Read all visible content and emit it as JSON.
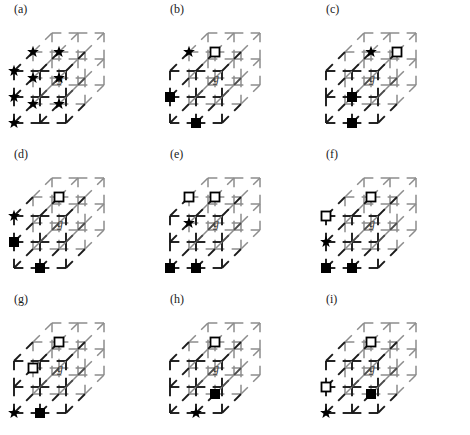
{
  "figure": {
    "type": "lattice-diagram-grid",
    "columns": 3,
    "rows": 3,
    "center_label": "g",
    "lattice": {
      "dimensions": [
        3,
        3,
        3
      ],
      "projection": "oblique",
      "edge_style": "broken-segments",
      "front_edge_color": "#1a1a1a",
      "interior_edge_color": "#8c8c8c",
      "depth_offset_x": 19,
      "depth_offset_y": -19,
      "cell_size": 26
    },
    "markers": {
      "star": {
        "name": "star-marker",
        "fill": "#000000",
        "label": "star"
      },
      "filled_square": {
        "name": "filled-square-marker",
        "fill": "#000000",
        "label": "filled square"
      },
      "open_square": {
        "name": "open-square-marker",
        "fill": "#ffffff",
        "stroke": "#000000",
        "label": "open square"
      }
    },
    "panels": [
      {
        "id": "a",
        "label": "(a)",
        "markers": [
          {
            "type": "star",
            "i": 0,
            "j": 0,
            "k": 0
          },
          {
            "type": "star",
            "i": 0,
            "j": 1,
            "k": 0
          },
          {
            "type": "star",
            "i": 0,
            "j": 2,
            "k": 0
          },
          {
            "type": "star",
            "i": 0,
            "j": 0,
            "k": 1
          },
          {
            "type": "star",
            "i": 0,
            "j": 1,
            "k": 1
          },
          {
            "type": "star",
            "i": 0,
            "j": 2,
            "k": 1
          },
          {
            "type": "star",
            "i": 1,
            "j": 0,
            "k": 1
          },
          {
            "type": "star",
            "i": 1,
            "j": 1,
            "k": 1
          },
          {
            "type": "star",
            "i": 1,
            "j": 2,
            "k": 1
          }
        ]
      },
      {
        "id": "b",
        "label": "(b)",
        "markers": [
          {
            "type": "star",
            "i": 0,
            "j": 2,
            "k": 1
          },
          {
            "type": "open_square",
            "i": 1,
            "j": 2,
            "k": 1
          },
          {
            "type": "filled_square",
            "i": 0,
            "j": 1,
            "k": 0
          },
          {
            "type": "filled_square",
            "i": 1,
            "j": 0,
            "k": 0
          }
        ]
      },
      {
        "id": "c",
        "label": "(c)",
        "markers": [
          {
            "type": "star",
            "i": 1,
            "j": 2,
            "k": 1
          },
          {
            "type": "open_square",
            "i": 2,
            "j": 2,
            "k": 1
          },
          {
            "type": "filled_square",
            "i": 1,
            "j": 1,
            "k": 0
          },
          {
            "type": "filled_square",
            "i": 1,
            "j": 0,
            "k": 0
          }
        ]
      },
      {
        "id": "d",
        "label": "(d)",
        "markers": [
          {
            "type": "open_square",
            "i": 1,
            "j": 2,
            "k": 1
          },
          {
            "type": "star",
            "i": 0,
            "j": 2,
            "k": 0
          },
          {
            "type": "filled_square",
            "i": 0,
            "j": 1,
            "k": 0
          },
          {
            "type": "filled_square",
            "i": 1,
            "j": 0,
            "k": 0
          }
        ]
      },
      {
        "id": "e",
        "label": "(e)",
        "markers": [
          {
            "type": "open_square",
            "i": 0,
            "j": 2,
            "k": 1
          },
          {
            "type": "open_square",
            "i": 1,
            "j": 2,
            "k": 1
          },
          {
            "type": "star",
            "i": 0,
            "j": 1,
            "k": 1
          },
          {
            "type": "filled_square",
            "i": 0,
            "j": 0,
            "k": 0
          },
          {
            "type": "filled_square",
            "i": 1,
            "j": 0,
            "k": 0
          }
        ]
      },
      {
        "id": "f",
        "label": "(f)",
        "markers": [
          {
            "type": "open_square",
            "i": 1,
            "j": 2,
            "k": 1
          },
          {
            "type": "open_square",
            "i": 0,
            "j": 2,
            "k": 0
          },
          {
            "type": "star",
            "i": 0,
            "j": 1,
            "k": 0
          },
          {
            "type": "filled_square",
            "i": 0,
            "j": 0,
            "k": 0
          },
          {
            "type": "filled_square",
            "i": 1,
            "j": 0,
            "k": 0
          }
        ]
      },
      {
        "id": "g",
        "label": "(g)",
        "markers": [
          {
            "type": "open_square",
            "i": 1,
            "j": 2,
            "k": 1
          },
          {
            "type": "open_square",
            "i": 0,
            "j": 1,
            "k": 1
          },
          {
            "type": "star",
            "i": 0,
            "j": 0,
            "k": 0
          },
          {
            "type": "filled_square",
            "i": 1,
            "j": 0,
            "k": 0
          }
        ]
      },
      {
        "id": "h",
        "label": "(h)",
        "markers": [
          {
            "type": "open_square",
            "i": 1,
            "j": 2,
            "k": 1
          },
          {
            "type": "star",
            "i": 1,
            "j": 0,
            "k": 0
          },
          {
            "type": "filled_square",
            "i": 1,
            "j": 0,
            "k": 1
          }
        ]
      },
      {
        "id": "i",
        "label": "(i)",
        "markers": [
          {
            "type": "open_square",
            "i": 1,
            "j": 2,
            "k": 1
          },
          {
            "type": "open_square",
            "i": 0,
            "j": 1,
            "k": 0
          },
          {
            "type": "filled_square",
            "i": 1,
            "j": 0,
            "k": 1
          },
          {
            "type": "star",
            "i": 0,
            "j": 0,
            "k": 0
          }
        ]
      }
    ]
  }
}
